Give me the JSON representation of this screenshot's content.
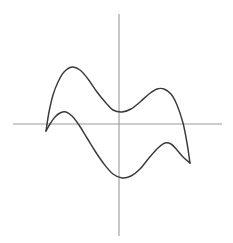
{
  "figure": {
    "background_color": "#ffffff",
    "width": 233,
    "height": 243,
    "title": "",
    "caption": ""
  },
  "axes": {
    "axis_color": "#999999",
    "x_axis": {
      "name": "horizontal-axis",
      "x_start": 13,
      "x_end": 222,
      "y": 124,
      "label": "",
      "ticks": []
    },
    "y_axis": {
      "name": "vertical-axis",
      "x": 119,
      "y_start": 14,
      "y_end": 236,
      "label": "",
      "ticks": []
    },
    "origin": {
      "x": 119,
      "y": 124
    }
  },
  "chart_data": {
    "type": "line",
    "title": "",
    "subtitle": "",
    "xlabel": "",
    "ylabel": "",
    "grid": false,
    "legend": null,
    "axis_ranges": {
      "xlim": [
        13,
        222
      ],
      "ylim": [
        236,
        14
      ]
    },
    "annotations": [],
    "curve_color": "#3a3a3a",
    "series": [
      {
        "name": "upper-branch",
        "stroke": "#3a3a3a",
        "closed": false,
        "points": [
          [
            46,
            131
          ],
          [
            49,
            112
          ],
          [
            53,
            95
          ],
          [
            58,
            82
          ],
          [
            64,
            72
          ],
          [
            72,
            67
          ],
          [
            80,
            70
          ],
          [
            88,
            79
          ],
          [
            97,
            92
          ],
          [
            106,
            103
          ],
          [
            113,
            110
          ],
          [
            122,
            112
          ],
          [
            131,
            109
          ],
          [
            140,
            102
          ],
          [
            149,
            94
          ],
          [
            157,
            89
          ],
          [
            164,
            89
          ],
          [
            171,
            94
          ],
          [
            177,
            105
          ],
          [
            183,
            123
          ],
          [
            187,
            143
          ],
          [
            190,
            163
          ]
        ]
      },
      {
        "name": "lower-branch",
        "stroke": "#3a3a3a",
        "closed": false,
        "points": [
          [
            46,
            131
          ],
          [
            50,
            124
          ],
          [
            55,
            117
          ],
          [
            60,
            113
          ],
          [
            66,
            112
          ],
          [
            72,
            116
          ],
          [
            79,
            125
          ],
          [
            87,
            138
          ],
          [
            95,
            151
          ],
          [
            104,
            164
          ],
          [
            113,
            174
          ],
          [
            122,
            178
          ],
          [
            131,
            176
          ],
          [
            140,
            169
          ],
          [
            149,
            158
          ],
          [
            158,
            148
          ],
          [
            165,
            143
          ],
          [
            171,
            144
          ],
          [
            177,
            150
          ],
          [
            183,
            157
          ],
          [
            190,
            163
          ]
        ]
      }
    ],
    "key_points": [
      {
        "name": "left-cusp",
        "x": 46,
        "y": 131
      },
      {
        "name": "upper-left-peak",
        "x": 72,
        "y": 67
      },
      {
        "name": "upper-valley",
        "x": 122,
        "y": 112
      },
      {
        "name": "upper-right-peak",
        "x": 163,
        "y": 89
      },
      {
        "name": "lower-left-peak",
        "x": 66,
        "y": 112
      },
      {
        "name": "lower-valley",
        "x": 122,
        "y": 178
      },
      {
        "name": "lower-right-peak",
        "x": 168,
        "y": 143
      },
      {
        "name": "right-cusp",
        "x": 190,
        "y": 163
      }
    ]
  }
}
